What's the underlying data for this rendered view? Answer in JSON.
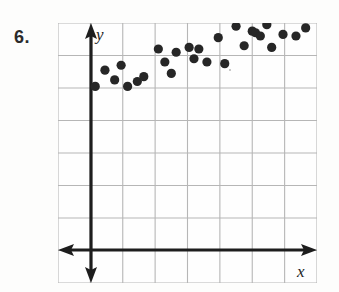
{
  "problem": {
    "number": "6."
  },
  "figure": {
    "axis_labels": {
      "y": "y",
      "x": "x"
    },
    "icons": {
      "y_arrow_up": "arrow-up-icon",
      "y_arrow_down": "arrow-down-icon",
      "x_arrow_left": "arrow-left-icon",
      "x_arrow_right": "arrow-right-icon"
    }
  },
  "colors": {
    "background": "#fdfdfc",
    "grid_line": "#b6b6b6",
    "axis_line": "#1d1d1d",
    "point_fill": "#262626",
    "text": "#2b2b2b"
  },
  "chart_data": {
    "type": "scatter",
    "title": "",
    "xlabel": "x",
    "ylabel": "y",
    "grid": true,
    "legend": null,
    "xlim": [
      -1,
      7
    ],
    "ylim": [
      -3,
      5
    ],
    "x_gridlines": [
      -1,
      0,
      1,
      2,
      3,
      4,
      5,
      6,
      7
    ],
    "y_gridlines": [
      -3,
      -2,
      -1,
      0,
      1,
      2,
      3,
      4,
      5
    ],
    "axis_origin": {
      "x": 0,
      "y": 0
    },
    "tick_labels_shown": false,
    "note": "Points show a positive linear association; coordinates estimated from one-unit grid squares.",
    "points": [
      {
        "x": 0.15,
        "y": 3.05
      },
      {
        "x": 0.45,
        "y": 3.55
      },
      {
        "x": 0.75,
        "y": 3.25
      },
      {
        "x": 0.95,
        "y": 3.7
      },
      {
        "x": 1.15,
        "y": 3.05
      },
      {
        "x": 1.45,
        "y": 3.2
      },
      {
        "x": 1.65,
        "y": 3.35
      },
      {
        "x": 2.1,
        "y": 4.2
      },
      {
        "x": 2.3,
        "y": 3.8
      },
      {
        "x": 2.5,
        "y": 3.45
      },
      {
        "x": 2.65,
        "y": 4.1
      },
      {
        "x": 3.05,
        "y": 4.25
      },
      {
        "x": 3.2,
        "y": 3.9
      },
      {
        "x": 3.35,
        "y": 4.2
      },
      {
        "x": 3.6,
        "y": 3.8
      },
      {
        "x": 3.95,
        "y": 4.55
      },
      {
        "x": 4.15,
        "y": 3.75
      },
      {
        "x": 4.5,
        "y": 4.9
      },
      {
        "x": 4.75,
        "y": 4.3
      },
      {
        "x": 5.0,
        "y": 4.75
      },
      {
        "x": 5.1,
        "y": 4.7
      },
      {
        "x": 5.25,
        "y": 4.6
      },
      {
        "x": 5.45,
        "y": 4.95
      },
      {
        "x": 5.6,
        "y": 4.25
      },
      {
        "x": 5.95,
        "y": 4.65
      },
      {
        "x": 6.2,
        "y": 5.25
      },
      {
        "x": 6.35,
        "y": 4.6
      },
      {
        "x": 6.65,
        "y": 4.85
      }
    ]
  }
}
